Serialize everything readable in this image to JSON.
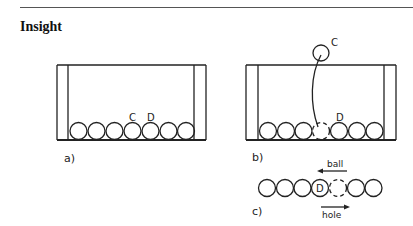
{
  "header": {
    "title": "Insight"
  },
  "figure": {
    "panels": [
      {
        "label": "a)",
        "ball_labels": [
          "C",
          "D"
        ],
        "ball_count": 7
      },
      {
        "label": "b)",
        "ball_labels": [
          "C",
          "D"
        ],
        "ball_count": 6,
        "hole_count": 1
      },
      {
        "label": "c)",
        "ball_labels": [
          "D"
        ],
        "arrows": {
          "top": "ball",
          "bottom": "hole"
        }
      }
    ],
    "labels": {
      "a_c": "C",
      "a_d": "D",
      "b_c": "C",
      "b_d": "D",
      "c_d": "D",
      "ball": "ball",
      "hole": "hole",
      "panel_a": "a)",
      "panel_b": "b)",
      "panel_c": "c)"
    }
  }
}
